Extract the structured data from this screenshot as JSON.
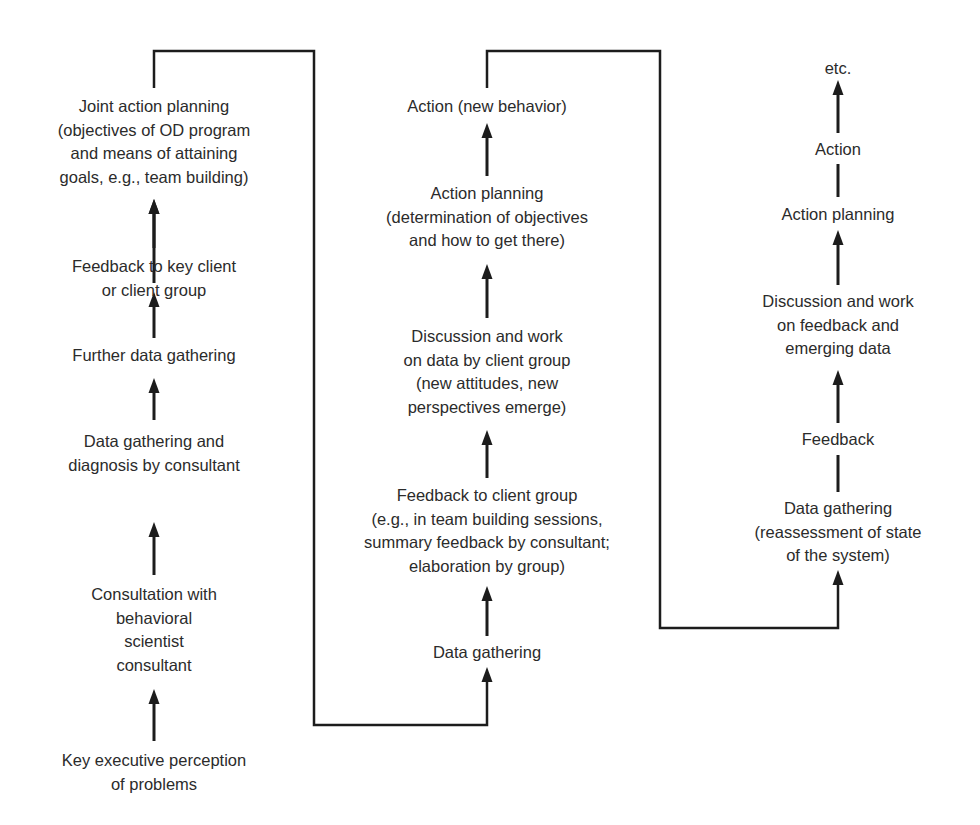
{
  "colors": {
    "background": "#ffffff",
    "ink": "#1c1c1c",
    "text": "#2b2b2b"
  },
  "columns": [
    {
      "id": "left",
      "center_x": 154,
      "nodes": [
        {
          "id": "joint-action-planning",
          "lines": [
            "Joint action planning",
            "(objectives of OD program",
            "and means of attaining",
            "goals, e.g., team building)"
          ],
          "top": 95
        },
        {
          "id": "feedback-key-client",
          "lines": [
            "Feedback to key client",
            "or client group"
          ],
          "top": 255
        },
        {
          "id": "further-data-gathering",
          "lines": [
            "Further data gathering"
          ],
          "top": 344
        },
        {
          "id": "data-gathering-diagnosis",
          "lines": [
            "Data gathering and",
            "diagnosis by consultant"
          ],
          "top": 430
        },
        {
          "id": "consultation-behavioral-scientist",
          "lines": [
            "Consultation with",
            "behavioral",
            "scientist",
            "consultant"
          ],
          "top": 583
        },
        {
          "id": "key-executive-perception",
          "lines": [
            "Key executive perception",
            "of problems"
          ],
          "top": 749
        }
      ]
    },
    {
      "id": "middle",
      "center_x": 487,
      "nodes": [
        {
          "id": "action-new-behavior",
          "lines": [
            "Action (new behavior)"
          ],
          "top": 95
        },
        {
          "id": "action-planning-middle",
          "lines": [
            "Action planning",
            "(determination of objectives",
            "and how to get there)"
          ],
          "top": 182
        },
        {
          "id": "discussion-work-data",
          "lines": [
            "Discussion and work",
            "on data by client group",
            "(new attitudes, new",
            "perspectives emerge)"
          ],
          "top": 325
        },
        {
          "id": "feedback-client-group",
          "lines": [
            "Feedback to client group",
            "(e.g., in team building sessions,",
            "summary feedback by consultant;",
            "elaboration by group)"
          ],
          "top": 484
        },
        {
          "id": "data-gathering-middle",
          "lines": [
            "Data gathering"
          ],
          "top": 641
        }
      ]
    },
    {
      "id": "right",
      "center_x": 838,
      "nodes": [
        {
          "id": "etc",
          "lines": [
            "etc."
          ],
          "top": 57
        },
        {
          "id": "action-right",
          "lines": [
            "Action"
          ],
          "top": 138
        },
        {
          "id": "action-planning-right",
          "lines": [
            "Action planning"
          ],
          "top": 203
        },
        {
          "id": "discussion-work-feedback",
          "lines": [
            "Discussion and work",
            "on feedback and",
            "emerging data"
          ],
          "top": 290
        },
        {
          "id": "feedback-right",
          "lines": [
            "Feedback"
          ],
          "top": 428
        },
        {
          "id": "data-gathering-right",
          "lines": [
            "Data gathering",
            "(reassessment of state",
            "of the system)"
          ],
          "top": 497
        }
      ]
    }
  ],
  "arrows": [
    {
      "x": 154,
      "y1": 283,
      "y2": 199,
      "head": true
    },
    {
      "x": 154,
      "y1": 248,
      "y2": 199,
      "head": true
    },
    {
      "x": 154,
      "y1": 338,
      "y2": 292,
      "head": true
    },
    {
      "x": 154,
      "y1": 420,
      "y2": 378,
      "head": true
    },
    {
      "x": 154,
      "y1": 575,
      "y2": 522,
      "head": true
    },
    {
      "x": 154,
      "y1": 741,
      "y2": 689,
      "head": true
    },
    {
      "x": 487,
      "y1": 176,
      "y2": 123,
      "head": true
    },
    {
      "x": 487,
      "y1": 318,
      "y2": 264,
      "head": true
    },
    {
      "x": 487,
      "y1": 478,
      "y2": 430,
      "head": true
    },
    {
      "x": 487,
      "y1": 636,
      "y2": 586,
      "head": true
    },
    {
      "x": 838,
      "y1": 133,
      "y2": 80,
      "head": true
    },
    {
      "x": 838,
      "y1": 197,
      "y2": 164,
      "head": false
    },
    {
      "x": 838,
      "y1": 285,
      "y2": 230,
      "head": true
    },
    {
      "x": 838,
      "y1": 423,
      "y2": 370,
      "head": true
    },
    {
      "x": 838,
      "y1": 492,
      "y2": 455,
      "head": false
    }
  ],
  "connectors": [
    {
      "id": "left-to-middle",
      "points": [
        [
          154,
          88
        ],
        [
          154,
          51
        ],
        [
          314,
          51
        ],
        [
          314,
          725
        ],
        [
          487,
          725
        ],
        [
          487,
          667
        ]
      ],
      "head": true
    },
    {
      "id": "middle-to-right",
      "points": [
        [
          487,
          88
        ],
        [
          487,
          51
        ],
        [
          660,
          51
        ],
        [
          660,
          628
        ],
        [
          838,
          628
        ],
        [
          838,
          570
        ]
      ],
      "head": true
    }
  ]
}
